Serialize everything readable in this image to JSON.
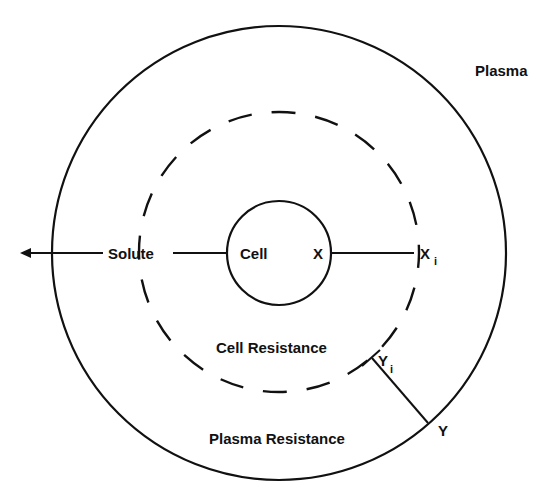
{
  "diagram": {
    "title": "",
    "colors": {
      "ink": "#111111",
      "background": "#ffffff"
    },
    "regions": {
      "plasma": {
        "label": "Plasma"
      },
      "cell": {
        "label": "Cell"
      },
      "cell_resistance": {
        "label": "Cell Resistance"
      },
      "plasma_resistance": {
        "label": "Plasma Resistance"
      }
    },
    "flow": {
      "solute_label": "Solute",
      "direction": "outward-left"
    },
    "points": {
      "x": {
        "label": "X"
      },
      "xi": {
        "label": "X",
        "subscript": "i"
      },
      "y": {
        "label": "Y"
      },
      "yi": {
        "label": "Y",
        "subscript": "i"
      }
    }
  }
}
